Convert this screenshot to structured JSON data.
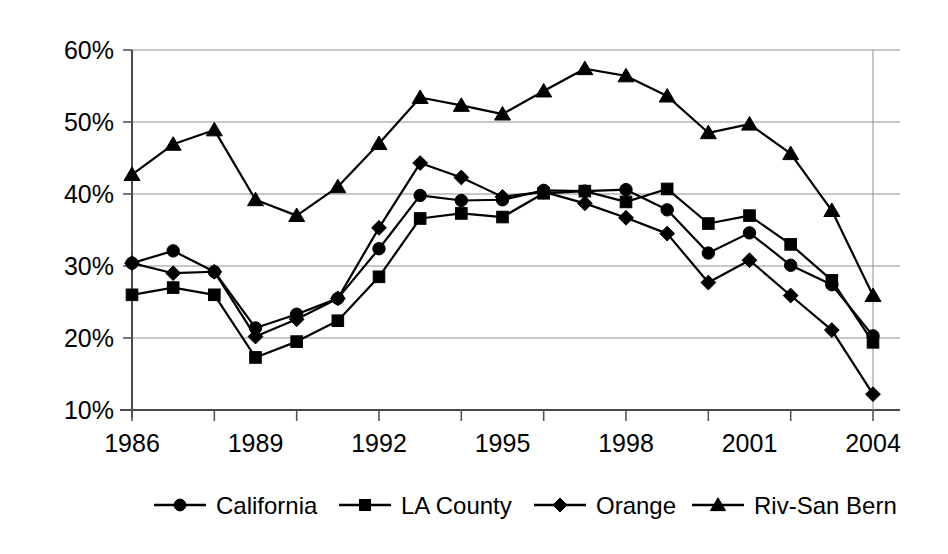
{
  "chart_data": {
    "type": "line",
    "title": "",
    "subtitle": "",
    "xlabel": "",
    "ylabel": "",
    "grid": true,
    "legend_position": "bottom",
    "xlim": [
      1986,
      2004
    ],
    "ylim": [
      10,
      60
    ],
    "y_tick_labels": [
      "60%",
      "50%",
      "40%",
      "30%",
      "20%",
      "10%"
    ],
    "y_ticks": [
      60,
      50,
      40,
      30,
      20,
      10
    ],
    "x_tick_labels": [
      "1986",
      "1989",
      "1992",
      "1995",
      "1998",
      "2001",
      "2004"
    ],
    "x_ticks": [
      1986,
      1989,
      1992,
      1995,
      1998,
      2001,
      2004
    ],
    "x_minor_ticks": [
      1986,
      1988,
      1990,
      1992,
      1994,
      1996,
      1998,
      2000,
      2002,
      2004
    ],
    "x": [
      1986,
      1987,
      1988,
      1989,
      1990,
      1991,
      1992,
      1993,
      1994,
      1995,
      1996,
      1997,
      1998,
      1999,
      2000,
      2001,
      2002,
      2003,
      2004
    ],
    "series": [
      {
        "name": "California",
        "marker": "circle",
        "values": [
          30.4,
          32.1,
          29.2,
          21.4,
          23.3,
          25.5,
          32.4,
          39.8,
          39.1,
          39.2,
          40.5,
          40.4,
          40.6,
          37.8,
          31.8,
          34.6,
          30.1,
          27.4,
          20.3
        ]
      },
      {
        "name": "LA County",
        "marker": "square",
        "values": [
          26.0,
          27.0,
          26.0,
          17.3,
          19.5,
          22.4,
          28.5,
          36.6,
          37.3,
          36.8,
          40.1,
          40.4,
          38.9,
          40.7,
          35.9,
          37.0,
          33.0,
          28.0,
          19.4
        ]
      },
      {
        "name": "Orange",
        "marker": "diamond",
        "values": [
          30.4,
          29.0,
          29.2,
          20.2,
          22.6,
          25.5,
          35.3,
          44.3,
          42.3,
          39.6,
          40.3,
          38.7,
          36.7,
          34.5,
          27.7,
          30.8,
          25.9,
          21.1,
          12.2
        ]
      },
      {
        "name": "Riv-San Bern",
        "marker": "triangle",
        "values": [
          42.7,
          46.9,
          48.9,
          39.2,
          37.0,
          41.0,
          47.0,
          53.4,
          52.3,
          51.1,
          54.3,
          57.4,
          56.4,
          53.6,
          48.5,
          49.7,
          45.6,
          37.7,
          25.9
        ]
      }
    ]
  },
  "legend": {
    "items": [
      {
        "label": "California",
        "marker": "circle"
      },
      {
        "label": "LA County",
        "marker": "square"
      },
      {
        "label": "Orange",
        "marker": "diamond"
      },
      {
        "label": "Riv-San Bern",
        "marker": "triangle"
      }
    ]
  },
  "colors": {
    "ink": "#000000",
    "grid": "#8f8f8f",
    "axis": "#4a4a4a",
    "background": "#ffffff"
  }
}
